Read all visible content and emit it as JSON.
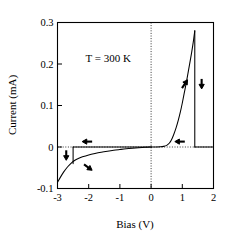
{
  "chart_data": {
    "type": "line",
    "title": "",
    "xlabel": "Bias (V)",
    "ylabel": "Current (mA)",
    "xlim": [
      -3,
      2
    ],
    "ylim": [
      -0.1,
      0.3
    ],
    "xticks": [
      -3,
      -2,
      -1,
      0,
      1,
      2
    ],
    "xticklabels": [
      "-3",
      "-2",
      "-1",
      "0",
      "1",
      "2"
    ],
    "yticks": [
      -0.1,
      0,
      0.1,
      0.2,
      0.3
    ],
    "yticklabels": [
      "-0.1",
      "0",
      "0.1",
      "0.2",
      "0.3"
    ],
    "grid": false,
    "legend": null,
    "reference_lines": [
      {
        "orientation": "vertical",
        "value": 0,
        "style": "dotted"
      },
      {
        "orientation": "horizontal",
        "value": 0,
        "style": "dotted"
      }
    ],
    "annotations": [
      {
        "text": "T = 300 K",
        "x": -2.1,
        "y": 0.205
      }
    ],
    "series": [
      {
        "name": "forward-sweep-positive",
        "comment": "exponential turn-on rising to switching peak",
        "points": [
          [
            0.0,
            0.0
          ],
          [
            0.15,
            0.0
          ],
          [
            0.3,
            0.0005
          ],
          [
            0.4,
            0.0015
          ],
          [
            0.5,
            0.004
          ],
          [
            0.58,
            0.009
          ],
          [
            0.65,
            0.017
          ],
          [
            0.72,
            0.029
          ],
          [
            0.8,
            0.046
          ],
          [
            0.87,
            0.064
          ],
          [
            0.94,
            0.085
          ],
          [
            1.0,
            0.106
          ],
          [
            1.06,
            0.129
          ],
          [
            1.12,
            0.152
          ],
          [
            1.18,
            0.177
          ],
          [
            1.24,
            0.202
          ],
          [
            1.3,
            0.228
          ],
          [
            1.35,
            0.252
          ],
          [
            1.4,
            0.28
          ]
        ]
      },
      {
        "name": "switch-down-positive",
        "comment": "vertical drop from peak back to zero current",
        "points": [
          [
            1.4,
            0.28
          ],
          [
            1.4,
            0.0
          ]
        ]
      },
      {
        "name": "return-sweep-positive",
        "comment": "low-current return branch along zero",
        "points": [
          [
            1.4,
            0.0
          ],
          [
            2.0,
            0.0
          ]
        ]
      },
      {
        "name": "zero-branch-negative",
        "comment": "flat near-zero branch from 0 V to switching point",
        "points": [
          [
            0.0,
            0.0
          ],
          [
            -1.0,
            0.0
          ],
          [
            -2.0,
            0.0
          ],
          [
            -2.5,
            0.0
          ]
        ]
      },
      {
        "name": "switch-down-negative",
        "comment": "vertical drop at negative switching bias",
        "points": [
          [
            -2.5,
            0.0
          ],
          [
            -2.5,
            -0.04
          ]
        ]
      },
      {
        "name": "reverse-sweep-negative",
        "comment": "high-conductance reverse branch",
        "points": [
          [
            -3.0,
            -0.085
          ],
          [
            -2.9,
            -0.072
          ],
          [
            -2.8,
            -0.06
          ],
          [
            -2.7,
            -0.05
          ],
          [
            -2.6,
            -0.042
          ],
          [
            -2.5,
            -0.035
          ],
          [
            -2.4,
            -0.03
          ],
          [
            -2.3,
            -0.0265
          ],
          [
            -2.2,
            -0.0235
          ],
          [
            -2.0,
            -0.019
          ],
          [
            -1.8,
            -0.0155
          ],
          [
            -1.6,
            -0.0125
          ],
          [
            -1.4,
            -0.01
          ],
          [
            -1.2,
            -0.0078
          ],
          [
            -1.0,
            -0.006
          ],
          [
            -0.8,
            -0.0043
          ],
          [
            -0.6,
            -0.0029
          ],
          [
            -0.4,
            -0.0017
          ],
          [
            -0.2,
            -0.0007
          ],
          [
            0.0,
            0.0
          ]
        ]
      }
    ],
    "direction_arrows": [
      {
        "name": "arrow-positive-rising",
        "x": 1.08,
        "y": 0.152,
        "direction": "up-right"
      },
      {
        "name": "arrow-positive-drop",
        "x": 1.62,
        "y": 0.152,
        "direction": "down"
      },
      {
        "name": "arrow-positive-return",
        "x": 0.92,
        "y": 0.013,
        "direction": "left"
      },
      {
        "name": "arrow-negative-zero-branch",
        "x": -2.05,
        "y": 0.013,
        "direction": "left"
      },
      {
        "name": "arrow-negative-drop",
        "x": -2.72,
        "y": -0.02,
        "direction": "down"
      },
      {
        "name": "arrow-negative-rising",
        "x": -2.02,
        "y": -0.049,
        "direction": "down-right"
      }
    ],
    "colors": {
      "curve": "#000000",
      "axis": "#000000",
      "background": "#ffffff"
    }
  },
  "axes": {
    "x_title": "Bias (V)",
    "y_title": "Current (mA)",
    "x_tick_labels": [
      "-3",
      "-2",
      "-1",
      "0",
      "1",
      "2"
    ],
    "y_tick_labels": [
      "0.3",
      "0.2",
      "0.1",
      "0",
      "-0.1"
    ]
  },
  "annotation": {
    "temperature": "T = 300 K"
  }
}
